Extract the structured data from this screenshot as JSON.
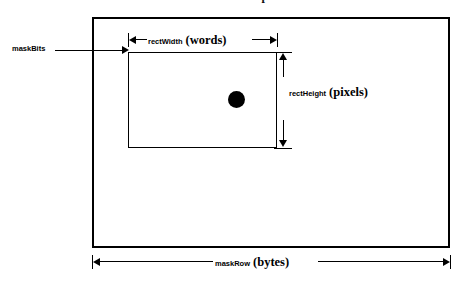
{
  "figure": {
    "title": "mask on map",
    "background_color": "#ffffff",
    "line_color": "#000000"
  },
  "outer_region": {
    "name": "mask bitmap",
    "label": "maskBits",
    "bottom_dimension": {
      "small_label": "maskRow",
      "unit_label": "(bytes)"
    }
  },
  "inner_region": {
    "name": "rect",
    "width_dimension": {
      "small_label": "rectWidth",
      "unit_label": "(words)"
    },
    "height_dimension": {
      "small_label": "rectHeight",
      "unit_label": "(pixels)"
    }
  },
  "pixel_dot": {
    "label": "pixel"
  }
}
